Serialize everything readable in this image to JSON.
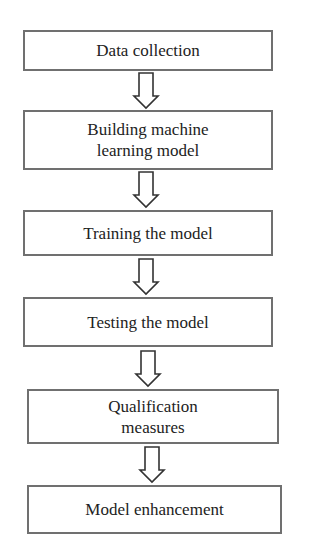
{
  "diagram": {
    "type": "flowchart",
    "direction": "top-to-bottom",
    "colors": {
      "background": "#ffffff",
      "border": "#707070",
      "text": "#222222",
      "arrow_stroke": "#333333"
    },
    "steps": [
      {
        "label": "Data collection"
      },
      {
        "label": "Building machine\nlearning model"
      },
      {
        "label": "Training the model"
      },
      {
        "label": "Testing the model"
      },
      {
        "label": "Qualification\nmeasures"
      },
      {
        "label": "Model enhancement"
      }
    ],
    "arrows": [
      {
        "from": 0,
        "to": 1,
        "icon": "hollow-down-arrow"
      },
      {
        "from": 1,
        "to": 2,
        "icon": "hollow-down-arrow"
      },
      {
        "from": 2,
        "to": 3,
        "icon": "hollow-down-arrow"
      },
      {
        "from": 3,
        "to": 4,
        "icon": "hollow-down-arrow"
      },
      {
        "from": 4,
        "to": 5,
        "icon": "hollow-down-arrow"
      }
    ]
  }
}
